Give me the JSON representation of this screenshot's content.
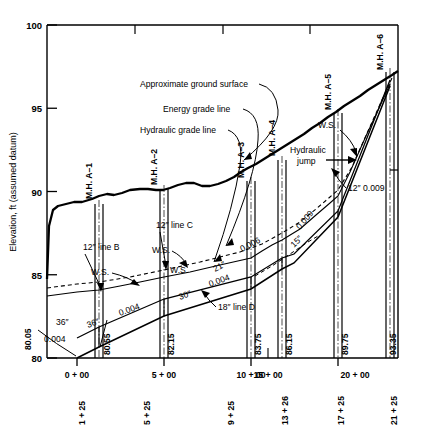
{
  "figure": {
    "kind": "sewer-profile-drawing",
    "y_axis_title": "Elevation, ft (assumed datum)",
    "y_ticks": [
      "100",
      "95",
      "90",
      "85",
      "80"
    ],
    "y_tick_values": [
      100,
      95,
      90,
      85,
      80
    ],
    "x_ticks": [
      "0 + 00",
      "5 + 00",
      "10 + 00",
      "15 + 00",
      "20 + 00"
    ],
    "x_tick_values": [
      0,
      500,
      1000,
      1500,
      2000
    ],
    "station_labels": [
      "1 + 25",
      "5 + 25",
      "9 + 25",
      "13 + 26",
      "17 + 25",
      "21 + 25"
    ],
    "station_values": [
      125,
      525,
      925,
      1326,
      1725,
      2125
    ],
    "invert_elevations": [
      "80.05",
      "80.55",
      "82.15",
      "83.75",
      "86.15",
      "89.75",
      "93.35"
    ],
    "manholes": [
      {
        "label": "M.H. A–1",
        "station": 125,
        "invert": "80.55"
      },
      {
        "label": "M.H. A–2",
        "station": 525,
        "invert": "82.15"
      },
      {
        "label": "M.H. A–3",
        "station": 925,
        "invert": "83.75"
      },
      {
        "label": "M.H. A–4",
        "station": 1326,
        "invert": "86.15"
      },
      {
        "label": "M.H. A–5",
        "station": 1725,
        "invert": "89.75"
      },
      {
        "label": "M.H. A–6",
        "station": 2125,
        "invert": "93.35"
      }
    ],
    "callouts": [
      {
        "name": "approximate-ground-surface",
        "text": "Approximate ground surface"
      },
      {
        "name": "energy-grade-line",
        "text": "Energy grade line"
      },
      {
        "name": "hydraulic-grade-line",
        "text": "Hydraulic grade line"
      },
      {
        "name": "hydraulic-jump-1",
        "text": "Hydraulic"
      },
      {
        "name": "hydraulic-jump-2",
        "text": "jump"
      },
      {
        "name": "line-b",
        "text": "12″ line B"
      },
      {
        "name": "line-c",
        "text": "12″ line C"
      },
      {
        "name": "line-d",
        "text": "18″ line D"
      }
    ],
    "water_surface_labels": [
      "W.S.",
      "W.S.",
      "W.S.",
      "W.S."
    ],
    "pipe_segments": [
      {
        "size": "36″",
        "slope": "0.004",
        "from": 0,
        "to": 125
      },
      {
        "size": "36″",
        "slope": "0.004",
        "from": 125,
        "to": 525
      },
      {
        "size": "30″",
        "slope": "0.004",
        "from": 525,
        "to": 925
      },
      {
        "size": "21″",
        "slope": "0.006",
        "from": 925,
        "to": 1326
      },
      {
        "size": "15″",
        "slope": "0.009",
        "from": 1326,
        "to": 1725
      },
      {
        "size": "12″",
        "slope": "0.009",
        "from": 1725,
        "to": 2125
      }
    ],
    "inline_annotations": [
      {
        "name": "size-36-a",
        "text": "36″"
      },
      {
        "name": "slope-0004-a",
        "text": "0.004"
      },
      {
        "name": "size-36-b",
        "text": "36″"
      },
      {
        "name": "slope-0004-b",
        "text": "0.004"
      },
      {
        "name": "size-30",
        "text": "30″"
      },
      {
        "name": "slope-0004-c",
        "text": "0.004"
      },
      {
        "name": "size-21",
        "text": "21″"
      },
      {
        "name": "slope-0006",
        "text": "0.006"
      },
      {
        "name": "size-15",
        "text": "15″"
      },
      {
        "name": "slope-0009-a",
        "text": "0.009"
      },
      {
        "name": "size-slope-12",
        "text": "12″  0.009"
      }
    ],
    "colors": {
      "ink": "#000000",
      "paper": "#ffffff"
    }
  }
}
